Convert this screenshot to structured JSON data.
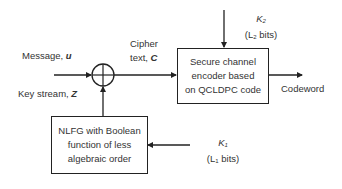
{
  "diagram": {
    "message": {
      "label": "Message, ",
      "symbol": "u"
    },
    "key_stream": {
      "label": "Key stream, ",
      "symbol": "Z"
    },
    "cipher_text": {
      "line1": "Cipher",
      "line2": "text, ",
      "symbol": "C"
    },
    "xor_node": {
      "type": "xor",
      "glyph": "⊕"
    },
    "encoder_box": {
      "lines": [
        "Secure channel",
        "encoder based",
        "on QCLDPC code"
      ]
    },
    "nlfg_box": {
      "lines": [
        "NLFG with Boolean",
        "function of less",
        "algebraic order"
      ]
    },
    "key2": {
      "name": "K",
      "sub": "2",
      "bits_prefix": "(L",
      "bits_sub": "2",
      "bits_suffix": " bits)"
    },
    "key1": {
      "name": "K",
      "sub": "1",
      "bits_prefix": "(L",
      "bits_sub": "1",
      "bits_suffix": " bits)"
    },
    "output": {
      "label": "Codeword"
    },
    "colors": {
      "line": "#222222",
      "text": "#333333",
      "background": "#ffffff"
    }
  }
}
